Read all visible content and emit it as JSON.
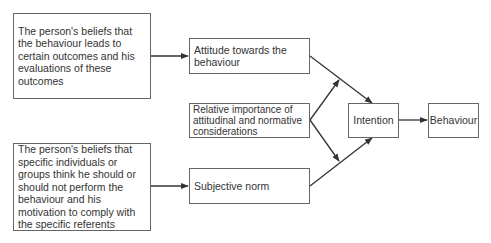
{
  "diagram": {
    "title": "",
    "nodes": {
      "beliefs_outcomes": "The person's beliefs that the behaviour leads to certain outcomes and his evaluations of these outcomes",
      "beliefs_referents": "The person's beliefs that specific individuals or groups think he should or should not perform the behaviour and his motivation to comply with the specific referents",
      "attitude": "Attitude towards the behaviour",
      "relative_importance": "Relative importance of attitudinal and normative considerations",
      "subjective_norm": "Subjective norm",
      "intention": "Intention",
      "behaviour": "Behaviour"
    },
    "edges": [
      {
        "from": "beliefs_outcomes",
        "to": "attitude"
      },
      {
        "from": "beliefs_referents",
        "to": "subjective_norm"
      },
      {
        "from": "attitude",
        "to": "intention"
      },
      {
        "from": "subjective_norm",
        "to": "intention"
      },
      {
        "from": "relative_importance",
        "to": "attitude-intention-edge"
      },
      {
        "from": "relative_importance",
        "to": "subjective_norm-intention-edge"
      },
      {
        "from": "intention",
        "to": "behaviour"
      }
    ],
    "colors": {
      "stroke": "#333333",
      "box_border": "#666666",
      "text": "#333333"
    }
  }
}
